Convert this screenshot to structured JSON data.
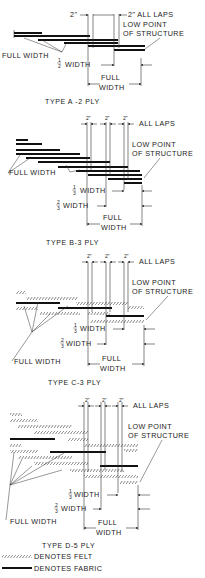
{
  "diagrams": [
    {
      "title": "TYPE A -2 PLY",
      "labels": {
        "lap_left": "2\"",
        "lap_right": "2\" ALL LAPS",
        "low_point_1": "LOW POINT",
        "low_point_2": "OF STRUCTURE",
        "full_width_leader": "FULL WIDTH",
        "frac_width": "WIDTH",
        "frac_num": "1",
        "frac_den": "2",
        "full_width_1": "FULL",
        "full_width_2": "WIDTH"
      }
    },
    {
      "title": "TYPE B-3 PLY",
      "labels": {
        "lap": "2\"",
        "all_laps": "ALL LAPS",
        "low_point_1": "LOW POINT",
        "low_point_2": "OF STRUCTURE",
        "full_width_leader": "FULL WIDTH",
        "third_num": "1",
        "third_den": "3",
        "twothird_num": "2",
        "twothird_den": "3",
        "frac_width": "WIDTH",
        "full_width_1": "FULL",
        "full_width_2": "WIDTH"
      }
    },
    {
      "title": "TYPE C-3 PLY",
      "labels": {
        "lap": "2\"",
        "all_laps": "ALL LAPS",
        "low_point_1": "LOW POINT",
        "low_point_2": "OF STRUCTURE",
        "full_width_leader": "FULL WIDTH",
        "third_num": "1",
        "third_den": "3",
        "twothird_num": "2",
        "twothird_den": "3",
        "frac_width": "WIDTH",
        "full_width_1": "FULL",
        "full_width_2": "WIDTH"
      }
    },
    {
      "title": "TYPE D-5 PLY",
      "labels": {
        "lap": "2\"",
        "all_laps": "ALL LAPS",
        "low_point_1": "LOW POINT",
        "low_point_2": "OF STRUCTURE",
        "full_width_leader": "FULL WIDTH",
        "third_num": "1",
        "third_den": "3",
        "twothird_num": "2",
        "twothird_den": "3",
        "frac_width": "WIDTH",
        "full_width_1": "FULL",
        "full_width_2": "WIDTH"
      }
    }
  ],
  "legend": {
    "felt": "DENOTES  FELT",
    "fabric": "DENOTES  FABRIC"
  }
}
